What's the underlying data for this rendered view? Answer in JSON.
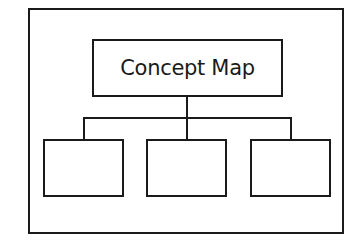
{
  "diagram": {
    "title": "Concept Map",
    "children": [
      "",
      "",
      ""
    ],
    "stroke_color": "#1a1a1a",
    "background": "#ffffff"
  }
}
